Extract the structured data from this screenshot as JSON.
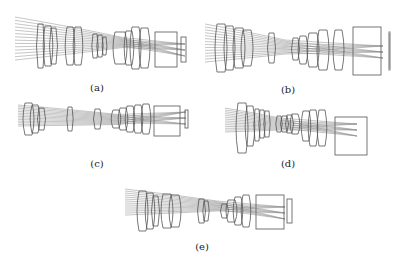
{
  "figure": {
    "colors": {
      "ray": "#7a7a7a",
      "lens": "#555555",
      "detector": "#666666",
      "background": "#ffffff"
    },
    "panels": [
      {
        "id": "a",
        "label": "(a)",
        "box": {
          "x": 15,
          "y": 15,
          "w": 175,
          "h": 62
        },
        "label_pos": {
          "x": 97,
          "y": 82
        },
        "ray_start_x": 0,
        "ray_top": 2,
        "ray_bottom": 45,
        "waist_x": 108,
        "waist_half": 5,
        "focus_x": 170,
        "focus_y": 35,
        "rays": 14,
        "lenses": [
          {
            "x": 23,
            "w": 5,
            "h": 44,
            "cy": 31
          },
          {
            "x": 30,
            "w": 6,
            "h": 40,
            "cy": 31
          },
          {
            "x": 36,
            "w": 5,
            "h": 36,
            "cy": 31
          },
          {
            "x": 52,
            "w": 6,
            "h": 38,
            "cy": 31
          },
          {
            "x": 60,
            "w": 6,
            "h": 38,
            "cy": 31
          },
          {
            "x": 78,
            "w": 4,
            "h": 24,
            "cy": 31
          },
          {
            "x": 83,
            "w": 4,
            "h": 22,
            "cy": 31
          },
          {
            "x": 88,
            "w": 3,
            "h": 18,
            "cy": 31
          },
          {
            "x": 100,
            "w": 10,
            "h": 32,
            "cy": 33
          },
          {
            "x": 111,
            "w": 6,
            "h": 34,
            "cy": 33
          },
          {
            "x": 117,
            "w": 7,
            "h": 42,
            "cy": 33
          },
          {
            "x": 126,
            "w": 7,
            "h": 40,
            "cy": 33
          }
        ],
        "prism": {
          "x": 140,
          "y": 17,
          "w": 22,
          "h": 35
        },
        "detector": {
          "x": 166,
          "y": 22,
          "w": 5,
          "h": 25
        }
      },
      {
        "id": "b",
        "label": "(b)",
        "box": {
          "x": 205,
          "y": 22,
          "w": 185,
          "h": 60
        },
        "label_pos": {
          "x": 288,
          "y": 84
        },
        "ray_start_x": 0,
        "ray_top": 2,
        "ray_bottom": 40,
        "waist_x": 80,
        "waist_half": 7,
        "focus_x": 178,
        "focus_y": 30,
        "rays": 14,
        "lenses": [
          {
            "x": 12,
            "w": 8,
            "h": 48,
            "cy": 26
          },
          {
            "x": 21,
            "w": 7,
            "h": 44,
            "cy": 26
          },
          {
            "x": 30,
            "w": 8,
            "h": 40,
            "cy": 26
          },
          {
            "x": 38,
            "w": 8,
            "h": 36,
            "cy": 26
          },
          {
            "x": 64,
            "w": 5,
            "h": 30,
            "cy": 26
          },
          {
            "x": 88,
            "w": 5,
            "h": 22,
            "cy": 27
          },
          {
            "x": 95,
            "w": 6,
            "h": 28,
            "cy": 28
          },
          {
            "x": 104,
            "w": 8,
            "h": 34,
            "cy": 28
          },
          {
            "x": 114,
            "w": 8,
            "h": 40,
            "cy": 28
          },
          {
            "x": 130,
            "w": 7,
            "h": 40,
            "cy": 28
          }
        ],
        "prism": {
          "x": 148,
          "y": 5,
          "w": 28,
          "h": 48
        },
        "detector": {
          "x": 184,
          "y": 10,
          "w": 1,
          "h": 38
        }
      },
      {
        "id": "c",
        "label": "(c)",
        "box": {
          "x": 18,
          "y": 104,
          "w": 175,
          "h": 36
        },
        "label_pos": {
          "x": 97,
          "y": 158
        },
        "ray_start_x": 0,
        "ray_top": 1,
        "ray_bottom": 22,
        "waist_x": 100,
        "waist_half": 5,
        "focus_x": 168,
        "focus_y": 14,
        "rays": 14,
        "lenses": [
          {
            "x": 7,
            "w": 7,
            "h": 32,
            "cy": 15
          },
          {
            "x": 14,
            "w": 6,
            "h": 28,
            "cy": 15
          },
          {
            "x": 21,
            "w": 5,
            "h": 22,
            "cy": 15
          },
          {
            "x": 50,
            "w": 4,
            "h": 24,
            "cy": 15
          },
          {
            "x": 77,
            "w": 5,
            "h": 20,
            "cy": 15
          },
          {
            "x": 95,
            "w": 6,
            "h": 18,
            "cy": 15
          },
          {
            "x": 102,
            "w": 6,
            "h": 22,
            "cy": 15
          },
          {
            "x": 109,
            "w": 6,
            "h": 26,
            "cy": 15
          },
          {
            "x": 117,
            "w": 6,
            "h": 28,
            "cy": 15
          },
          {
            "x": 125,
            "w": 6,
            "h": 30,
            "cy": 15
          }
        ],
        "prism": {
          "x": 136,
          "y": 2,
          "w": 26,
          "h": 30
        },
        "detector": {
          "x": 167,
          "y": 6,
          "w": 3,
          "h": 18
        }
      },
      {
        "id": "d",
        "label": "(d)",
        "box": {
          "x": 225,
          "y": 102,
          "w": 145,
          "h": 55
        },
        "label_pos": {
          "x": 288,
          "y": 158
        },
        "ray_start_x": 0,
        "ray_top": 6,
        "ray_bottom": 30,
        "waist_x": 55,
        "waist_half": 6,
        "focus_x": 132,
        "focus_y": 28,
        "rays": 14,
        "lenses": [
          {
            "x": 13,
            "w": 8,
            "h": 50,
            "cy": 26
          },
          {
            "x": 22,
            "w": 6,
            "h": 40,
            "cy": 24
          },
          {
            "x": 30,
            "w": 4,
            "h": 32,
            "cy": 23
          },
          {
            "x": 35,
            "w": 4,
            "h": 28,
            "cy": 22
          },
          {
            "x": 40,
            "w": 4,
            "h": 26,
            "cy": 22
          },
          {
            "x": 52,
            "w": 4,
            "h": 16,
            "cy": 22
          },
          {
            "x": 57,
            "w": 5,
            "h": 16,
            "cy": 22
          },
          {
            "x": 62,
            "w": 5,
            "h": 18,
            "cy": 22
          },
          {
            "x": 67,
            "w": 6,
            "h": 20,
            "cy": 22
          },
          {
            "x": 78,
            "w": 6,
            "h": 30,
            "cy": 24
          },
          {
            "x": 85,
            "w": 6,
            "h": 36,
            "cy": 26
          },
          {
            "x": 94,
            "w": 6,
            "h": 36,
            "cy": 26
          }
        ],
        "prism": {
          "x": 110,
          "y": 15,
          "w": 32,
          "h": 38
        },
        "detector": null
      },
      {
        "id": "e",
        "label": "(e)",
        "box": {
          "x": 125,
          "y": 185,
          "w": 170,
          "h": 55
        },
        "label_pos": {
          "x": 202,
          "y": 241
        },
        "ray_start_x": 0,
        "ray_top": 4,
        "ray_bottom": 30,
        "waist_x": 92,
        "waist_half": 5,
        "focus_x": 160,
        "focus_y": 28,
        "rays": 14,
        "lenses": [
          {
            "x": 14,
            "w": 7,
            "h": 40,
            "cy": 26
          },
          {
            "x": 22,
            "w": 6,
            "h": 36,
            "cy": 26
          },
          {
            "x": 28,
            "w": 5,
            "h": 30,
            "cy": 26
          },
          {
            "x": 38,
            "w": 8,
            "h": 34,
            "cy": 26
          },
          {
            "x": 46,
            "w": 8,
            "h": 32,
            "cy": 26
          },
          {
            "x": 74,
            "w": 5,
            "h": 24,
            "cy": 26
          },
          {
            "x": 79,
            "w": 4,
            "h": 20,
            "cy": 26
          },
          {
            "x": 97,
            "w": 5,
            "h": 14,
            "cy": 26
          },
          {
            "x": 103,
            "w": 7,
            "h": 22,
            "cy": 26
          },
          {
            "x": 110,
            "w": 6,
            "h": 28,
            "cy": 26
          },
          {
            "x": 118,
            "w": 6,
            "h": 32,
            "cy": 26
          }
        ],
        "prism": {
          "x": 131,
          "y": 10,
          "w": 28,
          "h": 34
        },
        "detector": {
          "x": 162,
          "y": 14,
          "w": 5,
          "h": 24
        }
      }
    ]
  }
}
